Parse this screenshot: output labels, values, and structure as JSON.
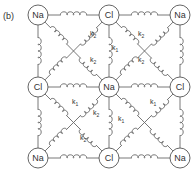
{
  "panel_label": "(b)",
  "atoms": [
    {
      "label": "Na",
      "x": 38,
      "y": 15
    },
    {
      "label": "Cl",
      "x": 109,
      "y": 15
    },
    {
      "label": "Na",
      "x": 180,
      "y": 15
    },
    {
      "label": "Cl",
      "x": 38,
      "y": 87
    },
    {
      "label": "Na",
      "x": 109,
      "y": 87
    },
    {
      "label": "Cl",
      "x": 180,
      "y": 87
    },
    {
      "label": "Na",
      "x": 38,
      "y": 158
    },
    {
      "label": "Cl",
      "x": 109,
      "y": 158
    },
    {
      "label": "Na",
      "x": 180,
      "y": 158
    }
  ],
  "spring_constants": {
    "nearest": "k",
    "nearest_sub": "1",
    "next_nearest": "k",
    "next_nearest_sub": "2"
  },
  "k_labels": [
    {
      "type": "k2",
      "x": 90,
      "y": 36
    },
    {
      "type": "k2",
      "x": 90,
      "y": 62
    },
    {
      "type": "k1",
      "x": 112,
      "y": 50
    },
    {
      "type": "k2",
      "x": 138,
      "y": 36
    },
    {
      "type": "k2",
      "x": 138,
      "y": 62
    },
    {
      "type": "k1",
      "x": 72,
      "y": 104
    },
    {
      "type": "k2",
      "x": 93,
      "y": 115
    },
    {
      "type": "k2",
      "x": 80,
      "y": 140
    },
    {
      "type": "k1",
      "x": 150,
      "y": 104
    },
    {
      "type": "k1",
      "x": 118,
      "y": 121
    }
  ]
}
